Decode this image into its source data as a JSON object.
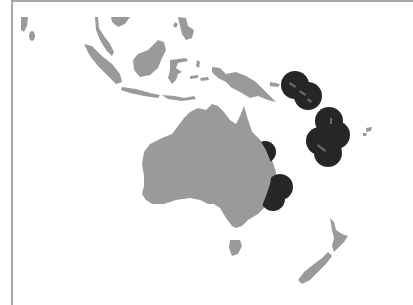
{
  "map": {
    "region": "Australia and Oceania",
    "colors": {
      "background": "#ffffff",
      "land": "#9a9a9a",
      "marker": "#262626",
      "frame": "#a8a8a8"
    },
    "landmasses": [
      "Sri Lanka / India tip",
      "Malay Peninsula",
      "Sumatra",
      "Java",
      "Borneo",
      "Sulawesi",
      "Philippines",
      "Timor / Lesser Sunda Islands",
      "New Guinea",
      "Australia",
      "Tasmania",
      "New Zealand North Island",
      "New Zealand South Island",
      "Fiji"
    ],
    "markers": [
      {
        "group": "Solomon Islands",
        "cx": 295,
        "cy": 85,
        "r": 14
      },
      {
        "group": "Solomon Islands",
        "cx": 308,
        "cy": 96,
        "r": 14
      },
      {
        "group": "Vanuatu",
        "cx": 329,
        "cy": 121,
        "r": 14
      },
      {
        "group": "Vanuatu",
        "cx": 336,
        "cy": 135,
        "r": 14
      },
      {
        "group": "New Caledonia",
        "cx": 320,
        "cy": 141,
        "r": 14
      },
      {
        "group": "New Caledonia",
        "cx": 328,
        "cy": 153,
        "r": 14
      },
      {
        "group": "East Australia north",
        "cx": 265,
        "cy": 152,
        "r": 11
      },
      {
        "group": "East Australia south",
        "cx": 280,
        "cy": 187,
        "r": 13
      },
      {
        "group": "East Australia south",
        "cx": 273,
        "cy": 199,
        "r": 12
      }
    ]
  }
}
